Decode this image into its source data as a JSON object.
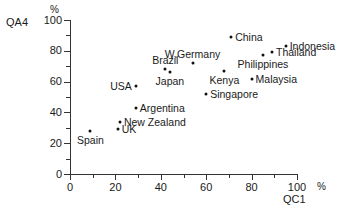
{
  "chart_data": {
    "type": "scatter",
    "title": "",
    "xlabel": "QC1",
    "ylabel": "QA4",
    "x_unit": "%",
    "y_unit": "%",
    "xlim": [
      0,
      100
    ],
    "ylim": [
      0,
      100
    ],
    "x_ticks": [
      "0",
      "20",
      "40",
      "60",
      "80",
      "100"
    ],
    "y_ticks": [
      "0",
      "20",
      "40",
      "60",
      "80",
      "100"
    ],
    "grid": false,
    "legend": "none",
    "points": [
      {
        "label": "Spain",
        "x": 9,
        "y": 28,
        "label_pos": "below"
      },
      {
        "label": "UK",
        "x": 21,
        "y": 29,
        "label_pos": "right"
      },
      {
        "label": "New Zealand",
        "x": 22,
        "y": 34,
        "label_pos": "right"
      },
      {
        "label": "Argentina",
        "x": 29,
        "y": 43,
        "label_pos": "right"
      },
      {
        "label": "USA",
        "x": 29,
        "y": 57,
        "label_pos": "left"
      },
      {
        "label": "Brazil",
        "x": 42,
        "y": 68,
        "label_pos": "above"
      },
      {
        "label": "Japan",
        "x": 44,
        "y": 66,
        "label_pos": "below"
      },
      {
        "label": "W.Germany",
        "x": 54,
        "y": 72,
        "label_pos": "above"
      },
      {
        "label": "Singapore",
        "x": 60,
        "y": 52,
        "label_pos": "right"
      },
      {
        "label": "Kenya",
        "x": 68,
        "y": 67,
        "label_pos": "below"
      },
      {
        "label": "China",
        "x": 71,
        "y": 89,
        "label_pos": "right"
      },
      {
        "label": "Malaysia",
        "x": 80,
        "y": 62,
        "label_pos": "right"
      },
      {
        "label": "Philippines",
        "x": 85,
        "y": 77,
        "label_pos": "below"
      },
      {
        "label": "Thailand",
        "x": 89,
        "y": 79,
        "label_pos": "right"
      },
      {
        "label": "Indonesia",
        "x": 95,
        "y": 83,
        "label_pos": "right"
      }
    ]
  },
  "axes": {
    "y_name": "QA4",
    "y_unit": "%",
    "x_name": "QC1",
    "x_unit": "%",
    "x_tick_labels": [
      "0",
      "20",
      "40",
      "60",
      "80",
      "100"
    ],
    "y_tick_labels": [
      "0",
      "20",
      "40",
      "60",
      "80",
      "100"
    ]
  },
  "style": {
    "axis_color": "#333333",
    "marker_color": "#111111",
    "text_color": "#1a1a1a",
    "background": "#ffffff"
  }
}
